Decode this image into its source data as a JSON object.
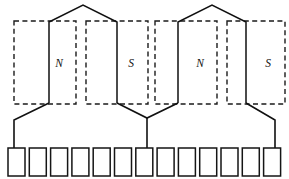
{
  "diagram": {
    "canvas": {
      "width": 289,
      "height": 179
    },
    "poles": [
      {
        "label": "N",
        "polarity": "north",
        "box_x": 14,
        "box_y": 21,
        "box_w": 62,
        "box_h": 83,
        "label_x": 59,
        "label_y": 64
      },
      {
        "label": "S",
        "polarity": "south",
        "box_x": 86,
        "box_y": 21,
        "box_w": 62,
        "box_h": 83,
        "label_x": 131,
        "label_y": 64
      },
      {
        "label": "N",
        "polarity": "north",
        "box_x": 155,
        "box_y": 21,
        "box_w": 62,
        "box_h": 83,
        "label_x": 200,
        "label_y": 64
      },
      {
        "label": "S",
        "polarity": "south",
        "box_x": 227,
        "box_y": 21,
        "box_w": 58,
        "box_h": 83,
        "label_x": 268,
        "label_y": 64
      }
    ],
    "coils": [
      {
        "name": "coil-left",
        "apex_x": 83,
        "apex_y": 5,
        "left_x": 49,
        "right_x": 117,
        "shoulder_y": 22,
        "body_bottom_y": 103,
        "vee_x": 83,
        "vee_y": 118
      },
      {
        "name": "coil-right",
        "apex_x": 212,
        "apex_y": 5,
        "left_x": 178,
        "right_x": 246,
        "shoulder_y": 22,
        "body_bottom_y": 103,
        "vee_x": 212,
        "vee_y": 118
      }
    ],
    "leads": [
      {
        "name": "lead-left",
        "from_x": 49,
        "from_y": 103,
        "bend_x": 14,
        "bend_y": 120,
        "to_y": 148,
        "slot_index": 1
      },
      {
        "name": "lead-center",
        "from_x": 147,
        "from_y": 118,
        "to_y": 148,
        "slot_index": 7
      },
      {
        "name": "lead-right",
        "from_x": 246,
        "from_y": 103,
        "bend_x": 275,
        "bend_y": 120,
        "to_y": 148,
        "slot_index": 13
      }
    ],
    "vee_connectors": [
      {
        "name": "vee-center",
        "left_x": 117,
        "left_y": 103,
        "mid_x": 147,
        "mid_y": 118,
        "right_x": 178,
        "right_y": 103
      }
    ],
    "slots": {
      "count": 13,
      "first_x": 8,
      "pitch": 21.3,
      "y": 148,
      "width": 17,
      "height": 28,
      "labels": [
        "1",
        "2",
        "3",
        "4",
        "5",
        "6",
        "7",
        "8",
        "9",
        "10",
        "11",
        "12",
        "13"
      ],
      "tapped_slots": [
        1,
        7,
        13
      ]
    },
    "colors": {
      "line": "#111111",
      "dashed": "#1a1a1a",
      "background": "#ffffff"
    }
  }
}
